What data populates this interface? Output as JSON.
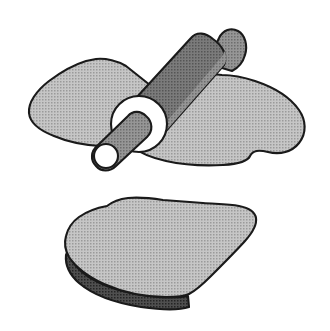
{
  "illustration": {
    "title": "Rolling pin flattening dough",
    "caption": "",
    "background_color": "#ffffff",
    "canvas": {
      "width": 330,
      "height": 331
    },
    "style": {
      "line_color": "#1a1a1a",
      "dough_fill": "#b0b0b0",
      "pin_body_fill": "#6e6e6e",
      "pin_body_highlight_fill": "#8a8a8a",
      "handle_fill": "#7a7a7a",
      "end_cap_fill": "#ffffff",
      "slab_edge_fill": "#4a4a4a",
      "shading": "halftone-dot"
    },
    "objects": [
      {
        "id": "dough-sheet-top",
        "name": "dough-sheet",
        "label": "Dough sheet being rolled",
        "fill": "#b0b0b0",
        "position": "upper"
      },
      {
        "id": "rolling-pin",
        "name": "rolling-pin",
        "label": "Rolling pin",
        "fill": "#6e6e6e",
        "position": "upper-center",
        "parts": [
          {
            "id": "pin-barrel",
            "label": "Barrel",
            "fill": "#6e6e6e"
          },
          {
            "id": "pin-barrel-highlight",
            "label": "Barrel highlight",
            "fill": "#8a8a8a"
          },
          {
            "id": "pin-end-cap",
            "label": "Near end cap",
            "fill": "#ffffff"
          },
          {
            "id": "pin-handle-near",
            "label": "Near handle",
            "fill": "#7a7a7a"
          },
          {
            "id": "pin-handle-near-tip",
            "label": "Near handle tip",
            "fill": "#ffffff"
          },
          {
            "id": "pin-handle-far",
            "label": "Far handle",
            "fill": "#7a7a7a"
          }
        ]
      },
      {
        "id": "dough-slab-bottom",
        "name": "dough-slab",
        "label": "Flattened dough slab",
        "fill": "#b0b0b0",
        "edge_fill": "#4a4a4a",
        "position": "lower"
      }
    ]
  }
}
